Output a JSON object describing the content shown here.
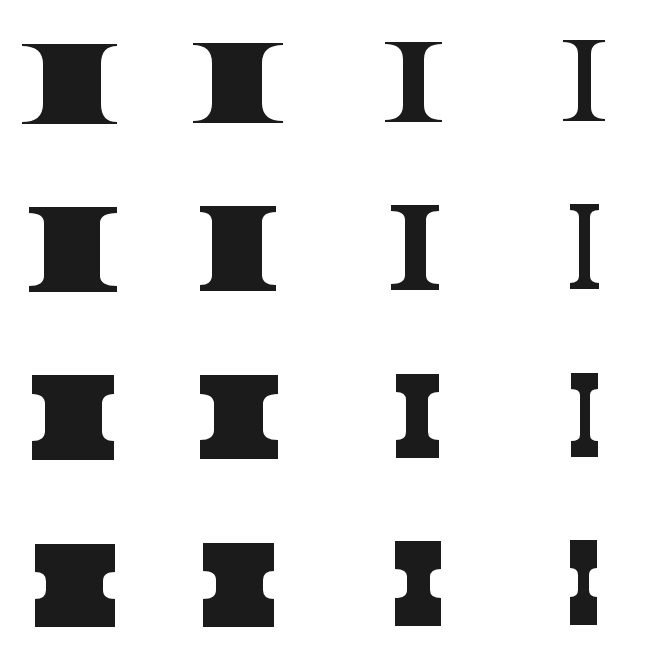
{
  "canvas": {
    "width": 651,
    "height": 645,
    "background": "#ffffff",
    "shape_color": "#1b1b1b"
  },
  "grid": {
    "rows": 4,
    "cols": 4,
    "description": "Grid of I-beam / spool shapes; cap thickness increases by row, waist width decreases by column"
  },
  "shapes": [
    {
      "row": 1,
      "col": 1,
      "x": 22,
      "y": 44,
      "w": 95,
      "h": 80,
      "cap": 2,
      "waist_l": 43,
      "waist_r": 101,
      "fillet": 18
    },
    {
      "row": 1,
      "col": 2,
      "x": 193,
      "y": 43,
      "w": 90,
      "h": 80,
      "cap": 2,
      "waist_l": 212,
      "waist_r": 262,
      "fillet": 18
    },
    {
      "row": 1,
      "col": 3,
      "x": 385,
      "y": 42,
      "w": 57,
      "h": 80,
      "cap": 2,
      "waist_l": 403,
      "waist_r": 424,
      "fillet": 15
    },
    {
      "row": 1,
      "col": 4,
      "x": 563,
      "y": 40,
      "w": 42,
      "h": 81,
      "cap": 2,
      "waist_l": 578,
      "waist_r": 591,
      "fillet": 12
    },
    {
      "row": 2,
      "col": 1,
      "x": 29,
      "y": 207,
      "w": 88,
      "h": 85,
      "cap": 6,
      "waist_l": 44,
      "waist_r": 100,
      "fillet": 10
    },
    {
      "row": 2,
      "col": 2,
      "x": 200,
      "y": 206,
      "w": 76,
      "h": 85,
      "cap": 6,
      "waist_l": 212,
      "waist_r": 262,
      "fillet": 10
    },
    {
      "row": 2,
      "col": 3,
      "x": 391,
      "y": 205,
      "w": 48,
      "h": 85,
      "cap": 6,
      "waist_l": 405,
      "waist_r": 426,
      "fillet": 9
    },
    {
      "row": 2,
      "col": 4,
      "x": 570,
      "y": 204,
      "w": 29,
      "h": 85,
      "cap": 6,
      "waist_l": 579,
      "waist_r": 590,
      "fillet": 7
    },
    {
      "row": 3,
      "col": 1,
      "x": 32,
      "y": 375,
      "w": 82,
      "h": 85,
      "cap": 19,
      "waist_l": 45,
      "waist_r": 102,
      "fillet": 10
    },
    {
      "row": 3,
      "col": 2,
      "x": 200,
      "y": 375,
      "w": 78,
      "h": 84,
      "cap": 19,
      "waist_l": 214,
      "waist_r": 263,
      "fillet": 10
    },
    {
      "row": 3,
      "col": 3,
      "x": 396,
      "y": 374,
      "w": 43,
      "h": 84,
      "cap": 18,
      "waist_l": 406,
      "waist_r": 428,
      "fillet": 8
    },
    {
      "row": 3,
      "col": 4,
      "x": 571,
      "y": 373,
      "w": 27,
      "h": 84,
      "cap": 16,
      "waist_l": 580,
      "waist_r": 590,
      "fillet": 6
    },
    {
      "row": 4,
      "col": 1,
      "x": 35,
      "y": 544,
      "w": 80,
      "h": 83,
      "cap": 28,
      "waist_l": 46,
      "waist_r": 103,
      "fillet": 9
    },
    {
      "row": 4,
      "col": 2,
      "x": 203,
      "y": 543,
      "w": 71,
      "h": 84,
      "cap": 28,
      "waist_l": 216,
      "waist_r": 263,
      "fillet": 9
    },
    {
      "row": 4,
      "col": 3,
      "x": 395,
      "y": 541,
      "w": 46,
      "h": 85,
      "cap": 28,
      "waist_l": 407,
      "waist_r": 430,
      "fillet": 8
    },
    {
      "row": 4,
      "col": 4,
      "x": 570,
      "y": 540,
      "w": 27,
      "h": 85,
      "cap": 28,
      "waist_l": 578,
      "waist_r": 589,
      "fillet": 7
    }
  ]
}
